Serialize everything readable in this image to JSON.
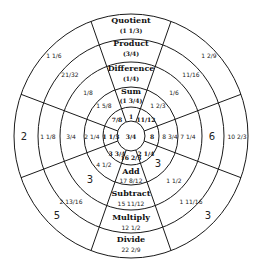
{
  "diagram": {
    "type": "fraction-operations-wheel",
    "center_value": "3/4",
    "operations": {
      "quotient": {
        "label": "Quotient",
        "value": "(1 1/3)"
      },
      "product": {
        "label": "Product",
        "value": "(3/4)"
      },
      "difference": {
        "label": "Difference",
        "value": "(1/4)"
      },
      "sum": {
        "label": "Sum",
        "value": "(1 3/4)"
      },
      "add": {
        "label": "Add",
        "value": "17 8/12"
      },
      "subtract": {
        "label": "Subtract",
        "value": "15 11/12"
      },
      "multiply": {
        "label": "Multiply",
        "value": "12 1/2"
      },
      "divide": {
        "label": "Divide",
        "value": "22 2/9"
      }
    },
    "inner_ring": {
      "top": "1",
      "upper_right": "11/12",
      "right": "8",
      "lower_right": "2 1/4",
      "bottom": "16 2/3",
      "lower_left": "3 3/4",
      "left": "1 1/3",
      "upper_left": "7/8"
    },
    "ring_sum": {
      "upper_left": "1 5/8",
      "upper_right": "1 2/3",
      "left": "2 1/4",
      "right": "8 3/4",
      "lower_left": "4 1/2",
      "lower_right": "3"
    },
    "ring_difference": {
      "upper_left": "1/8",
      "upper_right": "1/6",
      "left": "3/4",
      "right": "7 1/4",
      "lower_left": "3",
      "lower_right": "1 1/2"
    },
    "ring_product": {
      "upper_left": "21/32",
      "upper_right": "11/16",
      "left": "1 1/8",
      "right": "6",
      "lower_left": "2 13/16",
      "lower_right": "1 11/16"
    },
    "ring_quotient": {
      "upper_left": "1 1/6",
      "upper_right": "1 2/9",
      "left": "2",
      "right": "10 2/3",
      "lower_left": "5",
      "lower_right": "3"
    }
  }
}
